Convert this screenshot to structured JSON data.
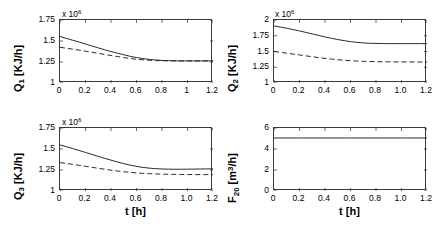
{
  "figure": {
    "background": "#ffffff",
    "line_color": "#2b2b2b",
    "axis_color": "#3a3a3a"
  },
  "chart_data": [
    {
      "id": "q1",
      "type": "line",
      "title": "",
      "xlabel": "",
      "ylabel": "Q_1 [KJ/h]",
      "ylabel_base": "Q",
      "ylabel_sub": "1",
      "ylabel_unit": " [KJ/h]",
      "exponent_label": "x 10",
      "exponent_value": "6",
      "xlim": [
        0,
        1.2
      ],
      "ylim": [
        1,
        1.75
      ],
      "xticks": [
        0,
        0.2,
        0.4,
        0.6,
        0.8,
        1,
        1.2
      ],
      "xticklabels": [
        "0",
        "0.2",
        "0.4",
        "0.6",
        "0.8",
        "1",
        "1.2"
      ],
      "yticks": [
        1,
        1.25,
        1.5,
        1.75
      ],
      "yticklabels": [
        "1",
        "1.25",
        "1.5",
        "1.75"
      ],
      "grid": false,
      "legend": "none",
      "series": [
        {
          "name": "solid",
          "style": "solid",
          "x": [
            0,
            0.05,
            0.1,
            0.15,
            0.2,
            0.25,
            0.3,
            0.35,
            0.4,
            0.45,
            0.5,
            0.55,
            0.6,
            0.65,
            0.7,
            0.75,
            0.8,
            0.85,
            0.9,
            0.95,
            1.0,
            1.05,
            1.1,
            1.15,
            1.2
          ],
          "values": [
            1.553,
            1.531,
            1.509,
            1.487,
            1.464,
            1.441,
            1.418,
            1.396,
            1.375,
            1.355,
            1.336,
            1.318,
            1.303,
            1.291,
            1.281,
            1.274,
            1.269,
            1.266,
            1.264,
            1.263,
            1.263,
            1.263,
            1.263,
            1.263,
            1.263
          ]
        },
        {
          "name": "dashed",
          "style": "dashed",
          "x": [
            0,
            0.05,
            0.1,
            0.15,
            0.2,
            0.25,
            0.3,
            0.35,
            0.4,
            0.45,
            0.5,
            0.55,
            0.6,
            0.65,
            0.7,
            0.75,
            0.8,
            0.85,
            0.9,
            0.95,
            1.0,
            1.05,
            1.1,
            1.15,
            1.2
          ],
          "values": [
            1.425,
            1.414,
            1.403,
            1.391,
            1.379,
            1.366,
            1.353,
            1.34,
            1.327,
            1.315,
            1.303,
            1.292,
            1.283,
            1.276,
            1.271,
            1.267,
            1.265,
            1.264,
            1.263,
            1.263,
            1.263,
            1.263,
            1.263,
            1.263,
            1.263
          ]
        }
      ]
    },
    {
      "id": "q2",
      "type": "line",
      "title": "",
      "xlabel": "",
      "ylabel": "Q_2 [KJ/h]",
      "ylabel_base": "Q",
      "ylabel_sub": "2",
      "ylabel_unit": " [KJ/h]",
      "exponent_label": "x 10",
      "exponent_value": "6",
      "xlim": [
        0,
        1.2
      ],
      "ylim": [
        1,
        2
      ],
      "xticks": [
        0,
        0.2,
        0.4,
        0.6,
        0.8,
        1.0,
        1.2
      ],
      "xticklabels": [
        "0",
        "0.2",
        "0.4",
        "0.6",
        "0.8",
        "1.0",
        "1.2"
      ],
      "yticks": [
        1,
        1.25,
        1.5,
        1.75,
        2
      ],
      "yticklabels": [
        "1",
        "1.25",
        "1.5",
        "1.75",
        "2"
      ],
      "grid": false,
      "legend": "none",
      "series": [
        {
          "name": "solid",
          "style": "solid",
          "x": [
            0,
            0.05,
            0.1,
            0.15,
            0.2,
            0.25,
            0.3,
            0.35,
            0.4,
            0.45,
            0.5,
            0.55,
            0.6,
            0.65,
            0.7,
            0.75,
            0.8,
            0.85,
            0.9,
            0.95,
            1.0,
            1.05,
            1.1,
            1.15,
            1.2
          ],
          "values": [
            1.905,
            1.888,
            1.869,
            1.848,
            1.826,
            1.803,
            1.779,
            1.755,
            1.732,
            1.71,
            1.69,
            1.672,
            1.657,
            1.645,
            1.637,
            1.631,
            1.628,
            1.626,
            1.625,
            1.625,
            1.625,
            1.625,
            1.625,
            1.625,
            1.625
          ]
        },
        {
          "name": "dashed",
          "style": "dashed",
          "x": [
            0,
            0.05,
            0.1,
            0.15,
            0.2,
            0.25,
            0.3,
            0.35,
            0.4,
            0.45,
            0.5,
            0.55,
            0.6,
            0.65,
            0.7,
            0.75,
            0.8,
            0.85,
            0.9,
            0.95,
            1.0,
            1.05,
            1.1,
            1.15,
            1.2
          ],
          "values": [
            1.5,
            1.487,
            1.473,
            1.459,
            1.445,
            1.431,
            1.417,
            1.403,
            1.391,
            1.38,
            1.37,
            1.361,
            1.354,
            1.348,
            1.344,
            1.341,
            1.338,
            1.337,
            1.336,
            1.335,
            1.335,
            1.335,
            1.334,
            1.334,
            1.334
          ]
        }
      ]
    },
    {
      "id": "q3",
      "type": "line",
      "title": "",
      "xlabel": "t [h]",
      "ylabel": "Q_3 [KJ/h]",
      "ylabel_base": "Q",
      "ylabel_sub": "3",
      "ylabel_unit": " [KJ/h]",
      "exponent_label": "x 10",
      "exponent_value": "6",
      "xlim": [
        0,
        1.2
      ],
      "ylim": [
        1,
        1.75
      ],
      "xticks": [
        0,
        0.2,
        0.4,
        0.6,
        0.8,
        1.0,
        1.2
      ],
      "xticklabels": [
        "0",
        "0.2",
        "0.4",
        "0.6",
        "0.8",
        "1.0",
        "1.2"
      ],
      "yticks": [
        1,
        1.25,
        1.5,
        1.75
      ],
      "yticklabels": [
        "1",
        "1.25",
        "1.5",
        "1.75"
      ],
      "grid": false,
      "legend": "none",
      "series": [
        {
          "name": "solid",
          "style": "solid",
          "x": [
            0,
            0.05,
            0.1,
            0.15,
            0.2,
            0.25,
            0.3,
            0.35,
            0.4,
            0.45,
            0.5,
            0.55,
            0.6,
            0.65,
            0.7,
            0.75,
            0.8,
            0.85,
            0.9,
            0.95,
            1.0,
            1.05,
            1.1,
            1.15,
            1.2
          ],
          "values": [
            1.548,
            1.527,
            1.505,
            1.482,
            1.459,
            1.436,
            1.412,
            1.389,
            1.367,
            1.346,
            1.326,
            1.308,
            1.293,
            1.281,
            1.272,
            1.266,
            1.262,
            1.26,
            1.259,
            1.259,
            1.26,
            1.261,
            1.262,
            1.263,
            1.264
          ]
        },
        {
          "name": "dashed",
          "style": "dashed",
          "x": [
            0,
            0.05,
            0.1,
            0.15,
            0.2,
            0.25,
            0.3,
            0.35,
            0.4,
            0.45,
            0.5,
            0.55,
            0.6,
            0.65,
            0.7,
            0.75,
            0.8,
            0.85,
            0.9,
            0.95,
            1.0,
            1.05,
            1.1,
            1.15,
            1.2
          ],
          "values": [
            1.338,
            1.328,
            1.317,
            1.306,
            1.294,
            1.282,
            1.27,
            1.259,
            1.248,
            1.238,
            1.229,
            1.222,
            1.215,
            1.21,
            1.206,
            1.203,
            1.201,
            1.199,
            1.198,
            1.197,
            1.196,
            1.196,
            1.195,
            1.195,
            1.195
          ]
        }
      ]
    },
    {
      "id": "f20",
      "type": "line",
      "title": "",
      "xlabel": "t [h]",
      "ylabel": "F_20 [m^3/h]",
      "ylabel_base": "F",
      "ylabel_sub": "20",
      "ylabel_unit": " [m",
      "ylabel_sup": "3",
      "ylabel_unit2": "/h]",
      "exponent_label": "",
      "exponent_value": "",
      "xlim": [
        0,
        1.2
      ],
      "ylim": [
        0,
        6
      ],
      "xticks": [
        0,
        0.2,
        0.4,
        0.6,
        0.8,
        1.0,
        1.2
      ],
      "xticklabels": [
        "0",
        "0.2",
        "0.4",
        "0.6",
        "0.8",
        "1.0",
        "1.2"
      ],
      "yticks": [
        0,
        2,
        4,
        6
      ],
      "yticklabels": [
        "0",
        "2",
        "4",
        "6"
      ],
      "grid": false,
      "legend": "none",
      "series": [
        {
          "name": "solid",
          "style": "solid",
          "x": [
            0,
            0.2,
            0.4,
            0.6,
            0.8,
            1.0,
            1.2
          ],
          "values": [
            5.05,
            5.05,
            5.05,
            5.05,
            5.05,
            5.05,
            5.05
          ]
        }
      ]
    }
  ]
}
